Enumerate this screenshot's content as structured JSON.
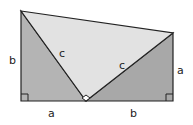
{
  "diagram": {
    "colors": {
      "left_triangle": "#b4b4b4",
      "right_triangle": "#a8a8a8",
      "middle_triangle": "#e2e2e2",
      "stroke": "#222222"
    },
    "labels": {
      "left_side": "b",
      "left_hyp": "c",
      "right_hyp": "c",
      "right_side": "a",
      "bottom_left": "a",
      "bottom_right": "b"
    }
  }
}
